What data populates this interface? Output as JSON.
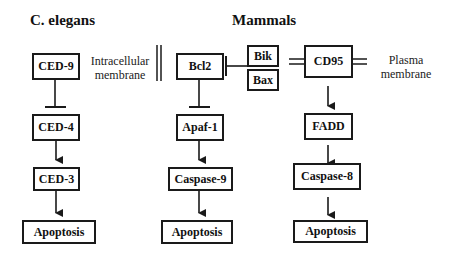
{
  "diagram": {
    "type": "apoptosis-pathway-comparison",
    "columns": [
      {
        "id": "c-elegans",
        "title": "C. elegans",
        "nodes": [
          "CED-9",
          "CED-4",
          "CED-3",
          "Apoptosis"
        ],
        "edges": [
          {
            "from": "CED-9",
            "to": "CED-4",
            "kind": "inhibits"
          },
          {
            "from": "CED-4",
            "to": "CED-3",
            "kind": "activates"
          },
          {
            "from": "CED-3",
            "to": "Apoptosis",
            "kind": "activates"
          }
        ]
      },
      {
        "id": "mammals-intrinsic",
        "title": "Mammals",
        "nodes": [
          "Bcl2",
          "Apaf-1",
          "Caspase-9",
          "Apoptosis"
        ],
        "regulators": [
          "Bik",
          "Bax"
        ],
        "edges": [
          {
            "from": "Bik/Bax",
            "to": "Bcl2",
            "kind": "inhibits"
          },
          {
            "from": "Bcl2",
            "to": "Apaf-1",
            "kind": "inhibits"
          },
          {
            "from": "Apaf-1",
            "to": "Caspase-9",
            "kind": "activates"
          },
          {
            "from": "Caspase-9",
            "to": "Apoptosis",
            "kind": "activates"
          }
        ]
      },
      {
        "id": "mammals-extrinsic",
        "nodes": [
          "CD95",
          "FADD",
          "Caspase-8",
          "Apoptosis"
        ],
        "edges": [
          {
            "from": "CD95",
            "to": "FADD",
            "kind": "activates"
          },
          {
            "from": "FADD",
            "to": "Caspase-8",
            "kind": "activates"
          },
          {
            "from": "Caspase-8",
            "to": "Apoptosis",
            "kind": "activates"
          }
        ]
      }
    ]
  },
  "titles": {
    "c_elegans": "C. elegans",
    "mammals": "Mammals"
  },
  "labels": {
    "intracellular_line1": "Intracellular",
    "intracellular_line2": "membrane",
    "plasma_line1": "Plasma",
    "plasma_line2": "membrane"
  },
  "nodes": {
    "ced9": "CED-9",
    "ced4": "CED-4",
    "ced3": "CED-3",
    "apoptosis_left": "Apoptosis",
    "bcl2": "Bcl2",
    "apaf1": "Apaf-1",
    "caspase9": "Caspase-9",
    "apoptosis_mid": "Apoptosis",
    "bik": "Bik",
    "bax": "Bax",
    "cd95": "CD95",
    "fadd": "FADD",
    "caspase8": "Caspase-8",
    "apoptosis_right": "Apoptosis"
  },
  "colors": {
    "line": "#1a1a1a",
    "background": "#ffffff"
  }
}
